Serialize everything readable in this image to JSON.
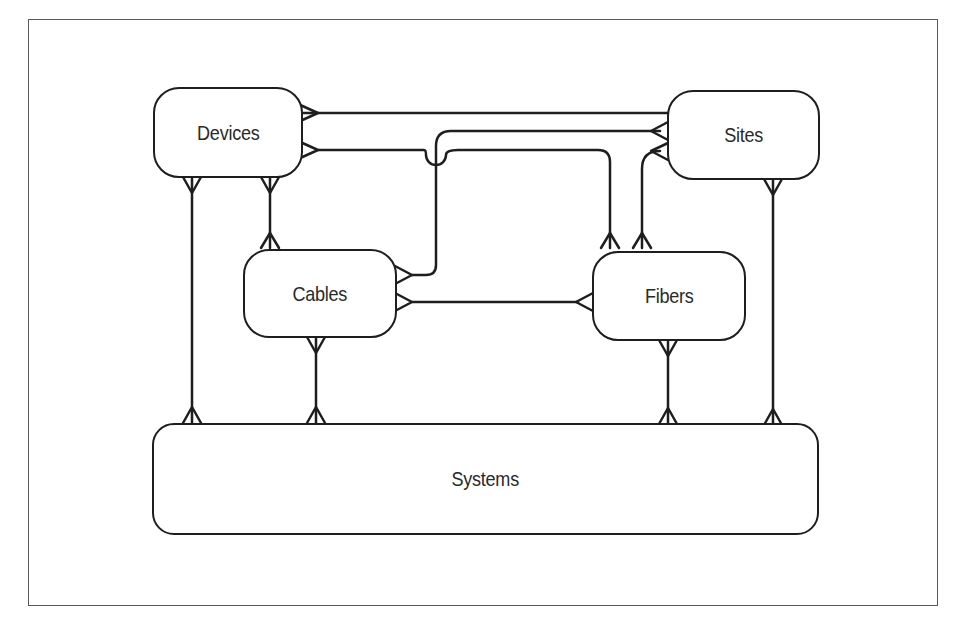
{
  "diagram": {
    "type": "entity-relationship",
    "entities": [
      {
        "id": "devices",
        "label": "Devices"
      },
      {
        "id": "sites",
        "label": "Sites"
      },
      {
        "id": "cables",
        "label": "Cables"
      },
      {
        "id": "fibers",
        "label": "Fibers"
      },
      {
        "id": "systems",
        "label": "Systems"
      }
    ],
    "relationships": [
      {
        "from": "devices",
        "to": "sites",
        "from_end": "many",
        "to_end": "one"
      },
      {
        "from": "devices",
        "to": "fibers",
        "from_end": "many",
        "to_end": "many"
      },
      {
        "from": "devices",
        "to": "cables",
        "from_end": "many",
        "to_end": "many"
      },
      {
        "from": "devices",
        "to": "systems",
        "from_end": "many",
        "to_end": "many"
      },
      {
        "from": "cables",
        "to": "sites",
        "from_end": "many",
        "to_end": "many"
      },
      {
        "from": "cables",
        "to": "fibers",
        "from_end": "many",
        "to_end": "many"
      },
      {
        "from": "cables",
        "to": "systems",
        "from_end": "many",
        "to_end": "many"
      },
      {
        "from": "sites",
        "to": "fibers",
        "from_end": "many",
        "to_end": "many"
      },
      {
        "from": "sites",
        "to": "systems",
        "from_end": "many",
        "to_end": "many"
      },
      {
        "from": "fibers",
        "to": "systems",
        "from_end": "many",
        "to_end": "many"
      }
    ],
    "colors": {
      "line": "#1e1e1e",
      "frame": "#5a5a5a",
      "background": "#ffffff"
    }
  }
}
